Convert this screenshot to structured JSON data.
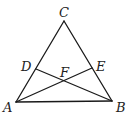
{
  "diagram": {
    "type": "geometry",
    "points": {
      "A": {
        "x": 16,
        "y": 102,
        "label": "A"
      },
      "B": {
        "x": 112,
        "y": 101,
        "label": "B"
      },
      "C": {
        "x": 64,
        "y": 21,
        "label": "C"
      },
      "D": {
        "x": 36,
        "y": 69,
        "label": "D"
      },
      "E": {
        "x": 92,
        "y": 68,
        "label": "E"
      },
      "F": {
        "x": 64,
        "y": 81,
        "label": "F"
      }
    },
    "segments": [
      [
        "A",
        "B"
      ],
      [
        "B",
        "C"
      ],
      [
        "C",
        "A"
      ],
      [
        "A",
        "E"
      ],
      [
        "B",
        "D"
      ]
    ],
    "stroke_color": "#1a1a1a"
  }
}
